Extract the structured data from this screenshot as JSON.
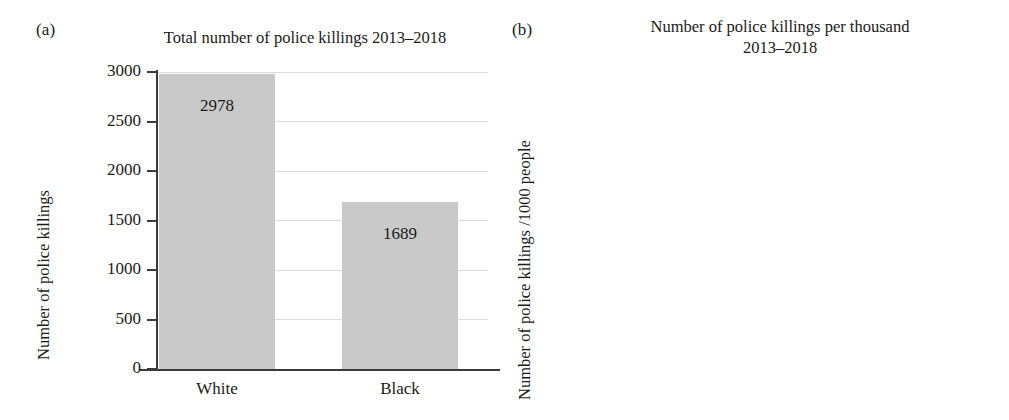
{
  "figure": {
    "panels": [
      {
        "letter": "(a)",
        "title": "Total number of police killings 2013–2018",
        "ylabel": "Number of police killings"
      },
      {
        "letter": "(b)",
        "title_line1": "Number of police killings per thousand",
        "title_line2": "2013–2018",
        "ylabel": "Number of police killings /1000 people"
      }
    ],
    "colors": {
      "bar_fill": "#c9c9c9",
      "axis": "#3b3b3b",
      "gridline": "#dcdcdc",
      "text": "#1a1a1a",
      "background": "#ffffff"
    }
  },
  "chart_data": [
    {
      "type": "bar",
      "panel": "(a)",
      "title": "Total number of police killings 2013–2018",
      "xlabel": "",
      "ylabel": "Number of police killings",
      "categories": [
        "White",
        "Black"
      ],
      "values": [
        2978,
        1689
      ],
      "value_labels": [
        "2978",
        "1689"
      ],
      "ylim": [
        0,
        3000
      ],
      "yticks": [
        0,
        500,
        1000,
        1500,
        2000,
        2500,
        3000
      ],
      "ytick_labels": [
        "0",
        "500",
        "1000",
        "1500",
        "2000",
        "2500",
        "3000"
      ],
      "grid": true,
      "legend": "none"
    },
    {
      "type": "bar",
      "panel": "(b)",
      "title": "Number of police killings per thousand 2013–2018",
      "xlabel": "",
      "ylabel": "Number of police killings /1000 people",
      "categories": [
        "White",
        "Black"
      ],
      "values": [
        1.2,
        3.94
      ],
      "value_labels": [
        "1.20",
        "3.94"
      ],
      "ylim": [
        0.0,
        4.0
      ],
      "yticks": [
        0.0,
        0.5,
        1.0,
        1.5,
        2.0,
        2.5,
        3.0,
        3.5,
        4.0
      ],
      "ytick_labels": [
        "0.0",
        "0.5",
        "1.0",
        "1.5",
        "2.0",
        "2.5",
        "3.0",
        "3.5",
        "4.0"
      ],
      "grid": true,
      "legend": "none"
    }
  ]
}
